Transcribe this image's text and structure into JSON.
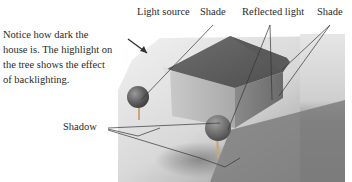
{
  "caption": "Notice how dark the house is. The highlight on the tree shows the effect of backlighting.",
  "labels": {
    "light_source": "Light source",
    "shade_left": "Shade",
    "reflected_light": "Reflected light",
    "shade_right": "Shade",
    "shadow": "Shadow"
  },
  "colors": {
    "background": "#ffffff",
    "text": "#2a2a2a",
    "house_dark": "#6a6a6a",
    "ground_shadow": "#7a7a7a",
    "leader_line": "#333333"
  }
}
